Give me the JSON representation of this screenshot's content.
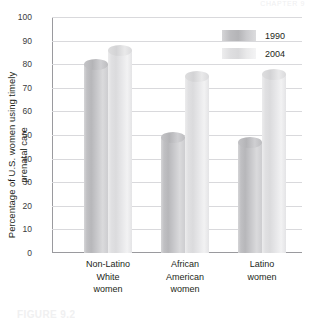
{
  "running_head": "CHAPTER 9",
  "figure_caption": "FIGURE 9.2",
  "legend": {
    "position": "top-right",
    "entries": [
      {
        "label": "1990",
        "color": "#bcbcbf",
        "swatch": "legend-swatch-1990"
      },
      {
        "label": "2004",
        "color": "#e2e2e4",
        "swatch": "legend-swatch-2004"
      }
    ]
  },
  "chart_data": {
    "type": "bar",
    "title": "",
    "subtitle": "",
    "xlabel": "",
    "ylabel": "Percentage of U.S. women using timely prenatal care",
    "categories": [
      "Non-Latino\nWhite\nwomen",
      "African\nAmerican\nwomen",
      "Latino\nwomen"
    ],
    "category_lines": [
      [
        "Non-Latino",
        "White",
        "women"
      ],
      [
        "African",
        "American",
        "women"
      ],
      [
        "Latino",
        "women"
      ]
    ],
    "series": [
      {
        "name": "1990",
        "values": [
          80,
          49,
          47
        ],
        "color": "#bcbcbf"
      },
      {
        "name": "2004",
        "values": [
          86,
          75,
          76
        ],
        "color": "#e2e2e4"
      }
    ],
    "ylim": [
      0,
      100
    ],
    "ytick_step": 10,
    "yticks": [
      100,
      90,
      80,
      70,
      60,
      50,
      40,
      30,
      20,
      10,
      0
    ],
    "ytick_labels": [
      "100",
      "90",
      "80",
      "70",
      "60",
      "50",
      "40",
      "30",
      "20",
      "10",
      "0"
    ],
    "grid": true,
    "grid_axis": "y",
    "legend_position": "top-right",
    "bar_style": "cylinder",
    "annotations": []
  }
}
